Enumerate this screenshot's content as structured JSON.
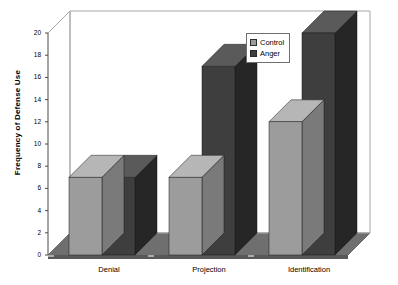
{
  "chart_data": {
    "type": "bar",
    "title": "",
    "subtitle": "",
    "xlabel": "",
    "ylabel": "Frequency of Defense Use",
    "categories": [
      "Denial",
      "Projection",
      "Identification"
    ],
    "series": [
      {
        "name": "Control",
        "values": [
          7,
          7,
          12
        ],
        "color": "#9c9c9c"
      },
      {
        "name": "Anger",
        "values": [
          7,
          17,
          20
        ],
        "color": "#3e3e3e"
      }
    ],
    "ylim": [
      0,
      20
    ],
    "ytick_step": 2,
    "yticks": [
      "0",
      "2",
      "4",
      "6",
      "8",
      "10",
      "12",
      "14",
      "16",
      "18",
      "20"
    ],
    "grid": false,
    "three_d": true,
    "legend_position": "top-right",
    "legend_entries": [
      "Control",
      "Anger"
    ]
  },
  "axes": {
    "y_title": "Frequency of Defense Use",
    "x_categories": [
      "Denial",
      "Projection",
      "Identification"
    ],
    "y_tick_labels": [
      "20",
      "18",
      "16",
      "14",
      "12",
      "10",
      "8",
      "6",
      "4",
      "2",
      "0"
    ]
  },
  "legend": {
    "entries": [
      {
        "label": "Control",
        "color": "#9c9c9c"
      },
      {
        "label": "Anger",
        "color": "#3e3e3e"
      }
    ]
  },
  "colors": {
    "control_front": "#9c9c9c",
    "control_top": "#b6b6b6",
    "control_side": "#7a7a7a",
    "anger_front": "#3e3e3e",
    "anger_top": "#5a5a5a",
    "anger_side": "#262626",
    "floor": "#6f6f6f",
    "floor_front": "#585858",
    "plot_background": "#ffffff",
    "frame": "#a8a8a8",
    "axis": "#4a4a4a"
  }
}
